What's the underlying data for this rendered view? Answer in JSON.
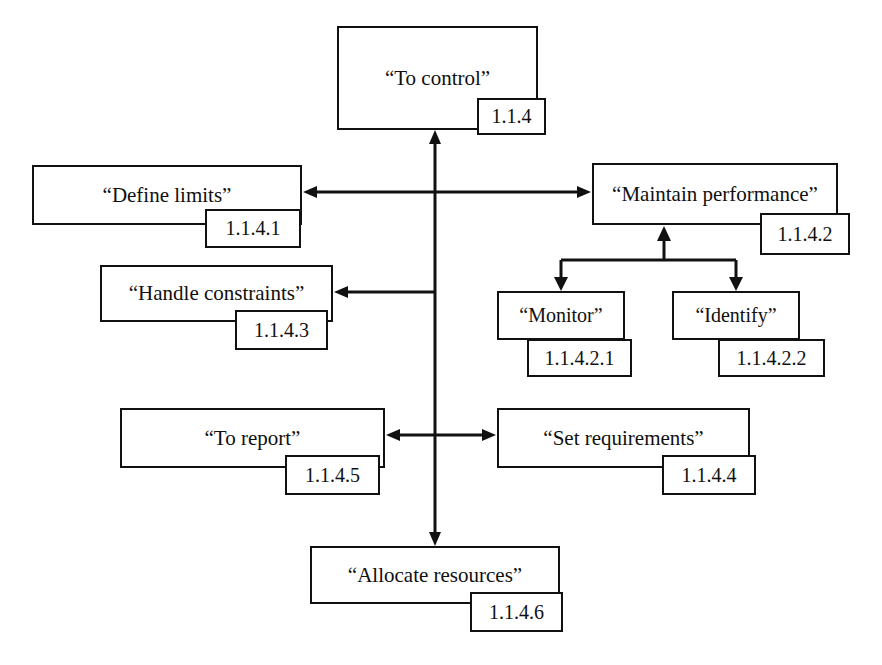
{
  "diagram": {
    "type": "functional-hierarchy",
    "line_color": "#111111",
    "box_fill": "#ffffff",
    "background": "#ffffff",
    "nodes": [
      {
        "key": "to_control",
        "label": "“To control”",
        "id": "1.1.4",
        "box": {
          "x": 337,
          "y": 26,
          "w": 201,
          "h": 104
        },
        "idbox": {
          "x": 477,
          "y": 98,
          "w": 69,
          "h": 37
        }
      },
      {
        "key": "define_limits",
        "label": "“Define limits”",
        "id": "1.1.4.1",
        "box": {
          "x": 32,
          "y": 165,
          "w": 270,
          "h": 60
        },
        "idbox": {
          "x": 205,
          "y": 209,
          "w": 96,
          "h": 39
        }
      },
      {
        "key": "maintain_performance",
        "label": "“Maintain performance”",
        "id": "1.1.4.2",
        "box": {
          "x": 592,
          "y": 163,
          "w": 246,
          "h": 62
        },
        "idbox": {
          "x": 760,
          "y": 213,
          "w": 90,
          "h": 42
        }
      },
      {
        "key": "handle_constraints",
        "label": "“Handle constraints”",
        "id": "1.1.4.3",
        "box": {
          "x": 100,
          "y": 265,
          "w": 233,
          "h": 57
        },
        "idbox": {
          "x": 235,
          "y": 310,
          "w": 93,
          "h": 40
        }
      },
      {
        "key": "monitor",
        "label": "“Monitor”",
        "id": "1.1.4.2.1",
        "box": {
          "x": 497,
          "y": 291,
          "w": 128,
          "h": 49
        },
        "idbox": {
          "x": 527,
          "y": 339,
          "w": 105,
          "h": 38
        }
      },
      {
        "key": "identify",
        "label": "“Identify”",
        "id": "1.1.4.2.2",
        "box": {
          "x": 672,
          "y": 291,
          "w": 128,
          "h": 49
        },
        "idbox": {
          "x": 718,
          "y": 339,
          "w": 107,
          "h": 38
        }
      },
      {
        "key": "to_report",
        "label": "“To report”",
        "id": "1.1.4.5",
        "box": {
          "x": 120,
          "y": 408,
          "w": 265,
          "h": 60
        },
        "idbox": {
          "x": 285,
          "y": 455,
          "w": 95,
          "h": 40
        }
      },
      {
        "key": "set_requirements",
        "label": "“Set requirements”",
        "id": "1.1.4.4",
        "box": {
          "x": 497,
          "y": 408,
          "w": 253,
          "h": 60
        },
        "idbox": {
          "x": 662,
          "y": 455,
          "w": 94,
          "h": 40
        }
      },
      {
        "key": "allocate_resources",
        "label": "“Allocate resources”",
        "id": "1.1.4.6",
        "box": {
          "x": 310,
          "y": 546,
          "w": 250,
          "h": 58
        },
        "idbox": {
          "x": 470,
          "y": 592,
          "w": 93,
          "h": 40
        }
      }
    ],
    "edges": [
      {
        "key": "spine",
        "from": "allocate_resources",
        "to": "to_control",
        "style": "vertical-spine"
      },
      {
        "key": "define-limits-maintain",
        "from": "define_limits",
        "to": "maintain_performance",
        "style": "bidirectional-horizontal"
      },
      {
        "key": "spine-to-handle-constraints",
        "from": "to_control",
        "to": "handle_constraints",
        "style": "arrow-left"
      },
      {
        "key": "spine-to-report",
        "from": "to_control",
        "to": "to_report",
        "style": "arrow-left"
      },
      {
        "key": "spine-to-set-requirements",
        "from": "to_control",
        "to": "set_requirements",
        "style": "arrow-right"
      },
      {
        "key": "maintain-branch-monitor",
        "from": "maintain_performance",
        "to": "monitor",
        "style": "arrow-down"
      },
      {
        "key": "maintain-branch-identify",
        "from": "maintain_performance",
        "to": "identify",
        "style": "arrow-down"
      },
      {
        "key": "branch-to-maintain",
        "from": "branch-bar",
        "to": "maintain_performance",
        "style": "arrow-up"
      }
    ]
  }
}
